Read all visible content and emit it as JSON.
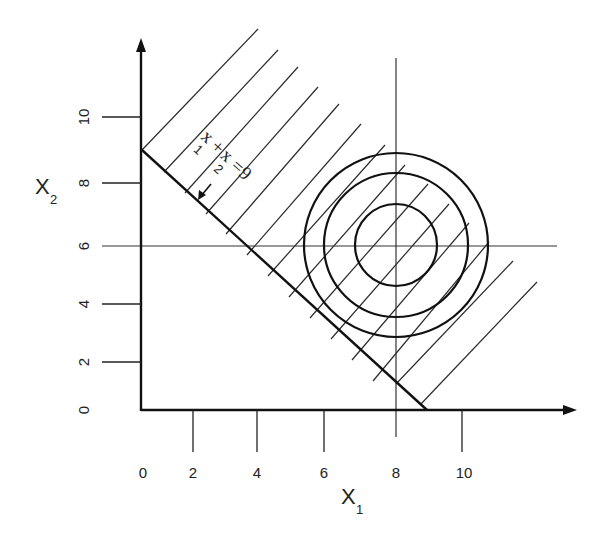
{
  "diagram": {
    "type": "linear-programming feasible region with objective contours",
    "x_axis": {
      "title": "X",
      "subscript": "1",
      "ticks": [
        "0",
        "2",
        "4",
        "6",
        "8",
        "10"
      ]
    },
    "y_axis": {
      "title": "X",
      "subscript": "2",
      "ticks": [
        "0",
        "2",
        "4",
        "6",
        "8",
        "10"
      ]
    },
    "constraint": {
      "label": "x1 + x2 = 9",
      "parts": [
        "x",
        "1",
        "+",
        "x",
        "2",
        "=9"
      ],
      "direction": "arrow points toward origin side",
      "hatched_side": "x1 + x2 ≥ 9"
    },
    "reference_lines": {
      "vertical_x1": "8",
      "horizontal_x2": "6"
    },
    "contours": {
      "center": [
        "8",
        "6"
      ],
      "count": 3,
      "shape": "concentric circles"
    },
    "colors": {
      "line": "#1a1a1a",
      "background": "#ffffff"
    }
  }
}
